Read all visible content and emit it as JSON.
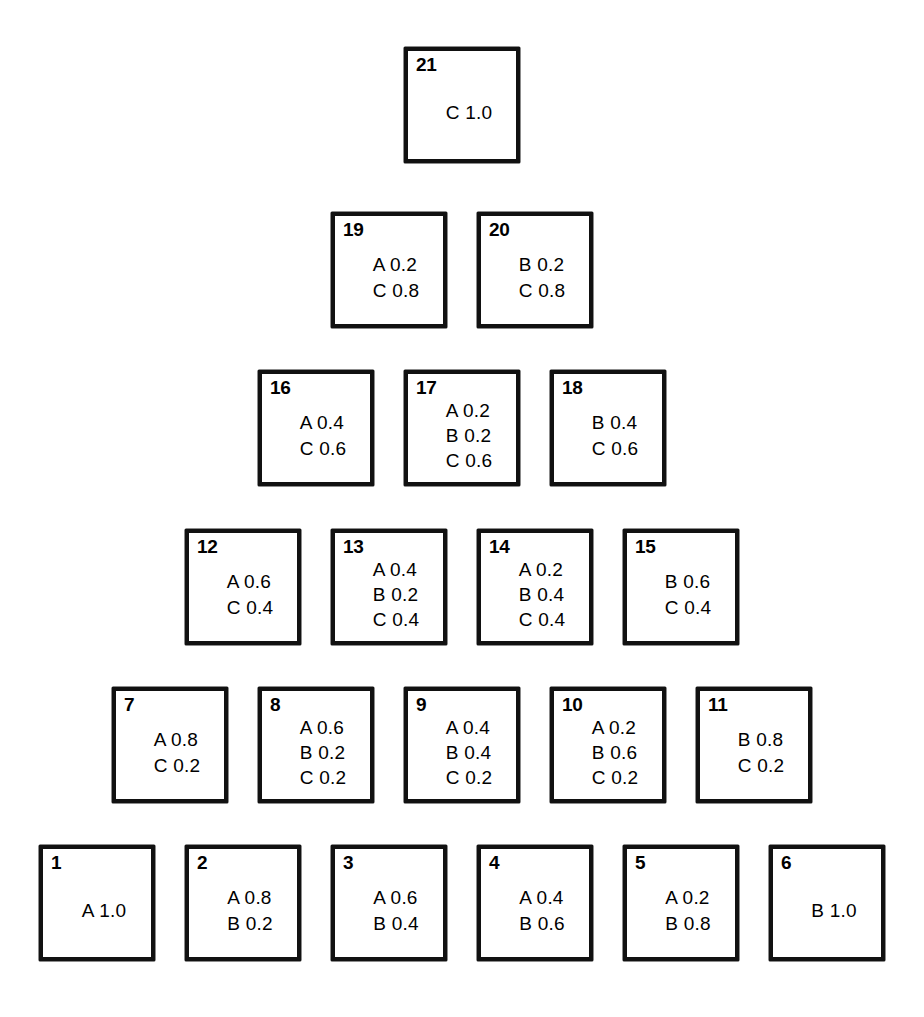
{
  "figure": {
    "kind": "simplex-lattice-design",
    "components": [
      "A",
      "B",
      "C"
    ],
    "rows_top_to_bottom": 6,
    "cell_count": 21,
    "background_color": "#ffffff",
    "line_color": "#111111"
  },
  "chart_data": {
    "type": "table",
    "title": "",
    "xlabel": "",
    "ylabel": "",
    "components": [
      "A",
      "B",
      "C"
    ],
    "rows": [
      {
        "row_index": 0,
        "cells": [
          {
            "id": "21",
            "lines": [
              "C 1.0"
            ],
            "values": {
              "A": 0.0,
              "B": 0.0,
              "C": 1.0
            }
          }
        ]
      },
      {
        "row_index": 1,
        "cells": [
          {
            "id": "19",
            "lines": [
              "A 0.2",
              "C 0.8"
            ],
            "values": {
              "A": 0.2,
              "B": 0.0,
              "C": 0.8
            }
          },
          {
            "id": "20",
            "lines": [
              "B 0.2",
              "C 0.8"
            ],
            "values": {
              "A": 0.0,
              "B": 0.2,
              "C": 0.8
            }
          }
        ]
      },
      {
        "row_index": 2,
        "cells": [
          {
            "id": "16",
            "lines": [
              "A 0.4",
              "C 0.6"
            ],
            "values": {
              "A": 0.4,
              "B": 0.0,
              "C": 0.6
            }
          },
          {
            "id": "17",
            "lines": [
              "A 0.2",
              "B 0.2",
              "C 0.6"
            ],
            "values": {
              "A": 0.2,
              "B": 0.2,
              "C": 0.6
            }
          },
          {
            "id": "18",
            "lines": [
              "B 0.4",
              "C 0.6"
            ],
            "values": {
              "A": 0.0,
              "B": 0.4,
              "C": 0.6
            }
          }
        ]
      },
      {
        "row_index": 3,
        "cells": [
          {
            "id": "12",
            "lines": [
              "A 0.6",
              "C 0.4"
            ],
            "values": {
              "A": 0.6,
              "B": 0.0,
              "C": 0.4
            }
          },
          {
            "id": "13",
            "lines": [
              "A 0.4",
              "B 0.2",
              "C 0.4"
            ],
            "values": {
              "A": 0.4,
              "B": 0.2,
              "C": 0.4
            }
          },
          {
            "id": "14",
            "lines": [
              "A 0.2",
              "B 0.4",
              "C 0.4"
            ],
            "values": {
              "A": 0.2,
              "B": 0.4,
              "C": 0.4
            }
          },
          {
            "id": "15",
            "lines": [
              "B 0.6",
              "C 0.4"
            ],
            "values": {
              "A": 0.0,
              "B": 0.6,
              "C": 0.4
            }
          }
        ]
      },
      {
        "row_index": 4,
        "cells": [
          {
            "id": "7",
            "lines": [
              "A 0.8",
              "C 0.2"
            ],
            "values": {
              "A": 0.8,
              "B": 0.0,
              "C": 0.2
            }
          },
          {
            "id": "8",
            "lines": [
              "A 0.6",
              "B 0.2",
              "C 0.2"
            ],
            "values": {
              "A": 0.6,
              "B": 0.2,
              "C": 0.2
            }
          },
          {
            "id": "9",
            "lines": [
              "A 0.4",
              "B 0.4",
              "C 0.2"
            ],
            "values": {
              "A": 0.4,
              "B": 0.4,
              "C": 0.2
            }
          },
          {
            "id": "10",
            "lines": [
              "A 0.2",
              "B 0.6",
              "C 0.2"
            ],
            "values": {
              "A": 0.2,
              "B": 0.6,
              "C": 0.2
            }
          },
          {
            "id": "11",
            "lines": [
              "B 0.8",
              "C 0.2"
            ],
            "values": {
              "A": 0.0,
              "B": 0.8,
              "C": 0.2
            }
          }
        ]
      },
      {
        "row_index": 5,
        "cells": [
          {
            "id": "1",
            "lines": [
              "A 1.0"
            ],
            "values": {
              "A": 1.0,
              "B": 0.0,
              "C": 0.0
            }
          },
          {
            "id": "2",
            "lines": [
              "A 0.8",
              "B 0.2"
            ],
            "values": {
              "A": 0.8,
              "B": 0.2,
              "C": 0.0
            }
          },
          {
            "id": "3",
            "lines": [
              "A 0.6",
              "B 0.4"
            ],
            "values": {
              "A": 0.6,
              "B": 0.4,
              "C": 0.0
            }
          },
          {
            "id": "4",
            "lines": [
              "A 0.4",
              "B 0.6"
            ],
            "values": {
              "A": 0.4,
              "B": 0.6,
              "C": 0.0
            }
          },
          {
            "id": "5",
            "lines": [
              "A 0.2",
              "B 0.8"
            ],
            "values": {
              "A": 0.2,
              "B": 0.8,
              "C": 0.0
            }
          },
          {
            "id": "6",
            "lines": [
              "B 1.0"
            ],
            "values": {
              "A": 0.0,
              "B": 1.0,
              "C": 0.0
            }
          }
        ]
      }
    ]
  }
}
